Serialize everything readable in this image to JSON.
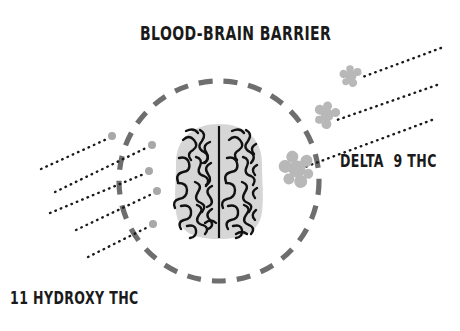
{
  "diagram": {
    "title": "BLOOD-BRAIN BARRIER",
    "background_color": "#ffffff",
    "labels": {
      "title": "BLOOD-BRAIN BARRIER",
      "delta9": "DELTA  9 THC",
      "hydroxy": "11 HYDROXY THC"
    },
    "colors": {
      "barrier_dash": "#6e6e6e",
      "brain_fill": "#d6d6d6",
      "brain_outline": "#111111",
      "molecule_gray": "#b8b8b8",
      "particle_gray": "#a0a0a0",
      "arrow_black": "#1a1a1a",
      "text": "#1a1a1a"
    },
    "barrier": {
      "name": "blood-brain-barrier-circle",
      "shape": "dashed-circle",
      "cx": 219,
      "cy": 181,
      "r": 100,
      "stroke_width": 5,
      "dash": "14 11"
    },
    "brain": {
      "name": "brain-illustration",
      "view": "top-down",
      "cx": 219,
      "cy": 181,
      "width": 86,
      "height": 112,
      "hemispheres": 2
    },
    "delta9_molecules": [
      {
        "name": "delta9-molecule-large",
        "cx": 297,
        "cy": 169,
        "size": 26
      },
      {
        "name": "delta9-molecule-mid",
        "cx": 327,
        "cy": 115,
        "size": 19
      },
      {
        "name": "delta9-molecule-small",
        "cx": 351,
        "cy": 76,
        "size": 15
      }
    ],
    "delta9_arrows": [
      {
        "name": "delta9-arrow-1",
        "x1": 441,
        "y1": 48,
        "x2": 360,
        "y2": 78
      },
      {
        "name": "delta9-arrow-2",
        "x1": 437,
        "y1": 85,
        "x2": 337,
        "y2": 120
      },
      {
        "name": "delta9-arrow-3",
        "x1": 432,
        "y1": 120,
        "x2": 305,
        "y2": 167
      }
    ],
    "hydroxy_particles": [
      {
        "name": "hydroxy-particle-1",
        "cx": 112,
        "cy": 136,
        "r": 4
      },
      {
        "name": "hydroxy-particle-2",
        "cx": 152,
        "cy": 145,
        "r": 4
      },
      {
        "name": "hydroxy-particle-3",
        "cx": 149,
        "cy": 171,
        "r": 4
      },
      {
        "name": "hydroxy-particle-4",
        "cx": 157,
        "cy": 191,
        "r": 4
      },
      {
        "name": "hydroxy-particle-5",
        "cx": 153,
        "cy": 224,
        "r": 4
      }
    ],
    "hydroxy_arrows": [
      {
        "name": "hydroxy-arrow-1",
        "x1": 41,
        "y1": 169,
        "x2": 107,
        "y2": 139
      },
      {
        "name": "hydroxy-arrow-2",
        "x1": 55,
        "y1": 192,
        "x2": 146,
        "y2": 148
      },
      {
        "name": "hydroxy-arrow-3",
        "x1": 50,
        "y1": 213,
        "x2": 144,
        "y2": 174
      },
      {
        "name": "hydroxy-arrow-4",
        "x1": 76,
        "y1": 230,
        "x2": 152,
        "y2": 194
      },
      {
        "name": "hydroxy-arrow-5",
        "x1": 88,
        "y1": 257,
        "x2": 148,
        "y2": 227
      }
    ],
    "annotations": {
      "delta9_meaning": "Delta 9 THC molecules blocked at the blood-brain barrier",
      "hydroxy_meaning": "11 Hydroxy THC particles crossing the blood-brain barrier"
    }
  }
}
